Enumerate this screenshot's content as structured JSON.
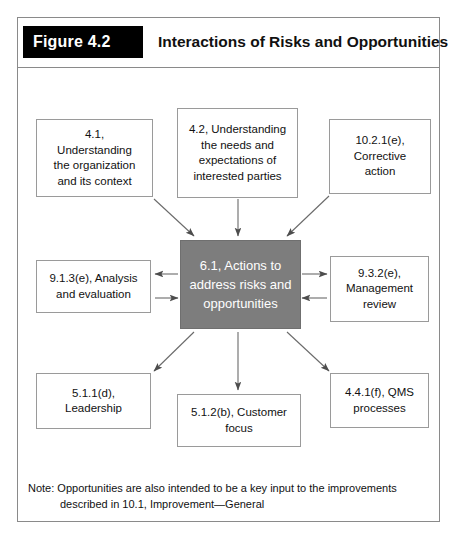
{
  "figure": {
    "tag": "Figure 4.2",
    "title": "Interactions of Risks and Opportunities",
    "note_line_1": "Note: Opportunities are also intended to be a key input to the improvements",
    "note_line_2": "described in 10.1, Improvement—General"
  },
  "colors": {
    "center_node_fill": "#7d7d7d",
    "center_node_text": "#ffffff",
    "node_border": "#9a9a9a",
    "frame_border": "#8a8a8a",
    "tag_background": "#000000",
    "tag_text": "#ffffff",
    "arrow": "#4d4d4d"
  },
  "chart_data": {
    "type": "diagram",
    "title": "Interactions of Risks and Opportunities",
    "center": {
      "id": "6.1",
      "label": "6.1, Actions to address risks and opportunities"
    },
    "nodes": [
      {
        "id": "4.1",
        "label": "4.1, Understanding the organization and its context",
        "position": "top-left"
      },
      {
        "id": "4.2",
        "label": "4.2, Understanding the needs and expectations of interested parties",
        "position": "top-center"
      },
      {
        "id": "10.2.1(e)",
        "label": "10.2.1(e), Corrective action",
        "position": "top-right"
      },
      {
        "id": "9.1.3(e)",
        "label": "9.1.3(e), Analysis and evaluation",
        "position": "middle-left"
      },
      {
        "id": "9.3.2(e)",
        "label": "9.3.2(e), Management review",
        "position": "middle-right"
      },
      {
        "id": "5.1.1(d)",
        "label": "5.1.1(d), Leadership",
        "position": "bottom-left"
      },
      {
        "id": "5.1.2(b)",
        "label": "5.1.2(b), Customer focus",
        "position": "bottom-center"
      },
      {
        "id": "4.4.1(f)",
        "label": "4.4.1(f), QMS processes",
        "position": "bottom-right"
      }
    ],
    "edges": [
      {
        "from": "4.1",
        "to": "6.1",
        "direction": "one-way"
      },
      {
        "from": "4.2",
        "to": "6.1",
        "direction": "one-way"
      },
      {
        "from": "10.2.1(e)",
        "to": "6.1",
        "direction": "one-way"
      },
      {
        "from": "9.1.3(e)",
        "to": "6.1",
        "direction": "two-way"
      },
      {
        "from": "6.1",
        "to": "9.3.2(e)",
        "direction": "two-way"
      },
      {
        "from": "6.1",
        "to": "5.1.1(d)",
        "direction": "one-way"
      },
      {
        "from": "6.1",
        "to": "5.1.2(b)",
        "direction": "one-way"
      },
      {
        "from": "6.1",
        "to": "4.4.1(f)",
        "direction": "one-way"
      }
    ]
  },
  "nodes": {
    "n4_1": "4.1,\nUnderstanding\nthe organization\nand its context",
    "n4_2": "4.2, Understanding\nthe needs and\nexpectations of\ninterested parties",
    "n10_2_1e": "10.2.1(e),\nCorrective\naction",
    "n9_1_3e": "9.1.3(e), Analysis\nand evaluation",
    "center": "6.1, Actions to\naddress risks and\nopportunities",
    "n9_3_2e": "9.3.2(e),\nManagement\nreview",
    "n5_1_1d": "5.1.1(d),\nLeadership",
    "n5_1_2b": "5.1.2(b), Customer\nfocus",
    "n4_4_1f": "4.4.1(f), QMS\nprocesses"
  }
}
